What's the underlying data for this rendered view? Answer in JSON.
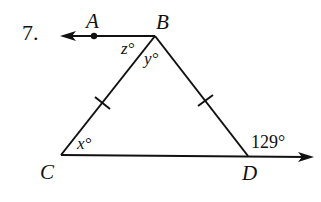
{
  "problem": {
    "number": "7."
  },
  "points": {
    "A": "A",
    "B": "B",
    "C": "C",
    "D": "D"
  },
  "angles": {
    "z": "z°",
    "y": "y°",
    "x": "x°",
    "exterior_D": "129°"
  },
  "colors": {
    "stroke": "#111111",
    "background": "#ffffff"
  }
}
